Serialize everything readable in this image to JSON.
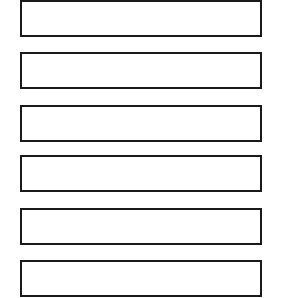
{
  "boxes": [
    {
      "label": "",
      "top": 0
    },
    {
      "label": "",
      "top": 52
    },
    {
      "label": "",
      "top": 105
    },
    {
      "label": "",
      "top": 155
    },
    {
      "label": "",
      "top": 208
    },
    {
      "label": "",
      "top": 260
    }
  ],
  "style": {
    "border_color": "#1a1a1a",
    "background": "#ffffff"
  }
}
